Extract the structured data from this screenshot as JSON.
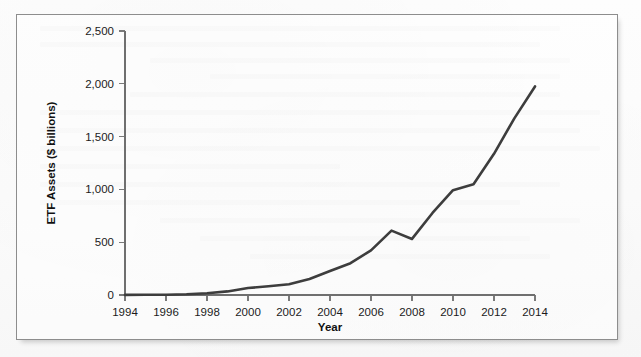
{
  "figure": {
    "frame_border_color": "#8d8d8d",
    "background_color": "#fbfbfb"
  },
  "chart_data": {
    "type": "line",
    "title": "",
    "xlabel": "Year",
    "ylabel": "ETF Assets ($ billions)",
    "xlim": [
      1994,
      2014
    ],
    "ylim": [
      0,
      2500
    ],
    "grid": false,
    "legend": false,
    "line_color": "#3d3d3d",
    "x_tick_labels": [
      "1994",
      "1996",
      "1998",
      "2000",
      "2002",
      "2004",
      "2006",
      "2008",
      "2010",
      "2012",
      "2014"
    ],
    "x_ticks": [
      1994,
      1996,
      1998,
      2000,
      2002,
      2004,
      2006,
      2008,
      2010,
      2012,
      2014
    ],
    "y_tick_labels": [
      "0",
      "500",
      "1,000",
      "1,500",
      "2,000",
      "2,500"
    ],
    "y_ticks": [
      0,
      500,
      1000,
      1500,
      2000,
      2500
    ],
    "x": [
      1994,
      1995,
      1996,
      1997,
      1998,
      1999,
      2000,
      2001,
      2002,
      2003,
      2004,
      2005,
      2006,
      2007,
      2008,
      2009,
      2010,
      2011,
      2012,
      2013,
      2014
    ],
    "series": [
      {
        "name": "ETF Assets",
        "values": [
          1,
          2,
          3,
          7,
          16,
          34,
          66,
          83,
          102,
          151,
          228,
          301,
          423,
          610,
          531,
          777,
          992,
          1048,
          1337,
          1675,
          1975
        ]
      }
    ]
  }
}
